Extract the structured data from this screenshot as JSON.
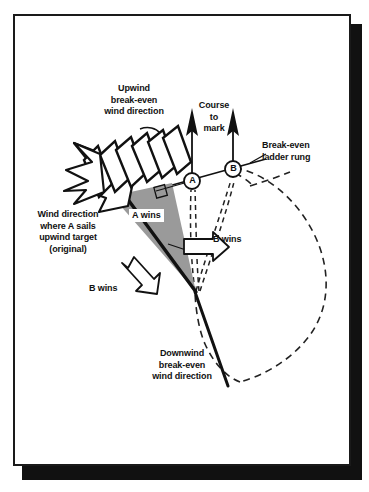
{
  "figure": {
    "background_color": "#ffffff",
    "ink_color": "#111111",
    "wedge_fill_color": "#9a9a9a"
  },
  "labels": {
    "upwind_break_even": "Upwind\nbreak-even\nwind direction",
    "course_to_mark": "Course\nto\nmark",
    "break_even_ladder_rung": "Break-even\nladder rung",
    "wind_direction_original": "Wind direction\nwhere A sails\nupwind target\n(original)",
    "a_wins": "A wins",
    "b_wins_right": "B wins",
    "b_wins_left": "B wins",
    "downwind_break_even": "Downwind\nbreak-even\nwind direction"
  },
  "boats": [
    {
      "id": "A",
      "label": "A",
      "x": 192,
      "y": 181
    },
    {
      "id": "B",
      "label": "B",
      "x": 233,
      "y": 169
    }
  ],
  "elements": {
    "course_arrows": [
      {
        "name": "course-arrow-a",
        "from_x": 192,
        "from_y": 178,
        "to_x": 192,
        "to_y": 110
      },
      {
        "name": "course-arrow-b",
        "from_x": 233,
        "from_y": 166,
        "to_x": 233,
        "to_y": 110
      }
    ],
    "ladder_rung_line": {
      "from_x": 160,
      "from_y": 188,
      "to_x": 263,
      "to_y": 160
    },
    "downwind_line": {
      "from_x": 195,
      "from_y": 292,
      "to_x": 228,
      "to_y": 386
    },
    "wind_arrow": {
      "direction": "down-left",
      "segments": 6
    },
    "polar_curve": {
      "type": "dashed-teardrop",
      "apex_x": 195,
      "apex_y": 292
    },
    "right_angle_marker": {
      "x": 163,
      "y": 190
    }
  }
}
